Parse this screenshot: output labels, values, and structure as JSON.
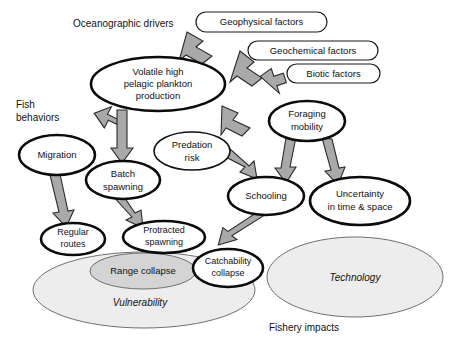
{
  "section_labels": {
    "oceanographic_drivers": "Oceanographic drivers",
    "fish_behaviors_line1": "Fish",
    "fish_behaviors_line2": "behaviors",
    "fishery_impacts": "Fishery impacts"
  },
  "pills": [
    {
      "id": "geophysical",
      "label": "Geophysical factors"
    },
    {
      "id": "geochemical",
      "label": "Geochemical factors"
    },
    {
      "id": "biotic",
      "label": "Biotic factors"
    }
  ],
  "nodes": [
    {
      "id": "volatile",
      "lines": [
        "Volatile high",
        "pelagic plankton",
        "production"
      ],
      "style": "bold-ellipse"
    },
    {
      "id": "migration",
      "lines": [
        "Migration"
      ],
      "style": "bold-ellipse"
    },
    {
      "id": "batch-spawning",
      "lines": [
        "Batch",
        "spawning"
      ],
      "style": "bold-ellipse"
    },
    {
      "id": "predation-risk",
      "lines": [
        "Predation",
        "risk"
      ],
      "style": "thin-ellipse"
    },
    {
      "id": "foraging-mobility",
      "lines": [
        "Foraging",
        "mobility"
      ],
      "style": "bold-ellipse"
    },
    {
      "id": "schooling",
      "lines": [
        "Schooling"
      ],
      "style": "bold-ellipse"
    },
    {
      "id": "uncertainty",
      "lines": [
        "Uncertainty",
        "in time & space"
      ],
      "style": "bold-ellipse"
    },
    {
      "id": "regular-routes",
      "lines": [
        "Regular",
        "routes"
      ],
      "style": "bold-ellipse"
    },
    {
      "id": "protracted-spawning",
      "lines": [
        "Protracted",
        "spawning"
      ],
      "style": "bold-ellipse"
    },
    {
      "id": "range-collapse",
      "lines": [
        "Range collapse"
      ],
      "style": "gray-ellipse"
    },
    {
      "id": "catchability-collapse",
      "lines": [
        "Catchability",
        "collapse"
      ],
      "style": "bold-ellipse"
    }
  ],
  "groups": [
    {
      "id": "vulnerability",
      "label": "Vulnerability"
    },
    {
      "id": "technology",
      "label": "Technology"
    }
  ],
  "edges": [
    {
      "from": "geophysical",
      "to": "volatile"
    },
    {
      "from": "geochemical",
      "to": "volatile"
    },
    {
      "from": "biotic",
      "to": "volatile"
    },
    {
      "from": "volatile",
      "to": "migration"
    },
    {
      "from": "volatile",
      "to": "batch-spawning"
    },
    {
      "from": "volatile",
      "to": "foraging-mobility"
    },
    {
      "from": "migration",
      "to": "regular-routes"
    },
    {
      "from": "batch-spawning",
      "to": "protracted-spawning"
    },
    {
      "from": "predation-risk",
      "to": "schooling"
    },
    {
      "from": "foraging-mobility",
      "to": "schooling"
    },
    {
      "from": "foraging-mobility",
      "to": "uncertainty"
    },
    {
      "from": "schooling",
      "to": "catchability-collapse"
    }
  ],
  "colors": {
    "arrow_fill": "#a9a9a9",
    "arrow_stroke": "#2b2b2b",
    "node_stroke": "#0b0b0b",
    "group_fill": "#ededed",
    "range_fill": "#d4d4d4",
    "background": "#ffffff",
    "text": "#111111"
  }
}
